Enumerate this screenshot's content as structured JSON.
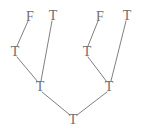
{
  "figure": {
    "kind": "binary-tree-diagram",
    "width": 146,
    "height": 137,
    "background_color": "#ffffff",
    "edge_color": "#808080",
    "label_color": "#6e6e6e",
    "edge_width": 1
  },
  "nodes": [
    {
      "id": "leaf-1",
      "label": "F",
      "x": 30,
      "y": 17,
      "level": 0,
      "role": "leaf"
    },
    {
      "id": "leaf-2",
      "label": "T",
      "x": 53,
      "y": 16,
      "level": 0,
      "role": "leaf"
    },
    {
      "id": "leaf-3",
      "label": "F",
      "x": 100,
      "y": 17,
      "level": 0,
      "role": "leaf"
    },
    {
      "id": "leaf-4",
      "label": "T",
      "x": 127,
      "y": 16,
      "level": 0,
      "role": "leaf"
    },
    {
      "id": "inner-left",
      "label": "T",
      "x": 15,
      "y": 52,
      "level": 1,
      "role": "internal"
    },
    {
      "id": "inner-right",
      "label": "T",
      "x": 87,
      "y": 52,
      "level": 1,
      "role": "internal"
    },
    {
      "id": "mid-left",
      "label": "T",
      "x": 40,
      "y": 87,
      "level": 2,
      "role": "internal"
    },
    {
      "id": "mid-right",
      "label": "T",
      "x": 109,
      "y": 87,
      "level": 2,
      "role": "internal"
    },
    {
      "id": "root",
      "label": "T",
      "x": 73,
      "y": 120,
      "level": 3,
      "role": "root"
    }
  ],
  "edges": [
    {
      "id": "edge-f1-innerleft",
      "from": "leaf-1",
      "to": "inner-left",
      "x1": 28,
      "y1": 21,
      "x2": 17,
      "y2": 46
    },
    {
      "id": "edge-t2-midleft",
      "from": "leaf-2",
      "to": "mid-left",
      "x1": 52,
      "y1": 21,
      "x2": 41,
      "y2": 81
    },
    {
      "id": "edge-innerleft-midleft",
      "from": "inner-left",
      "to": "mid-left",
      "x1": 17,
      "y1": 57,
      "x2": 38,
      "y2": 82
    },
    {
      "id": "edge-f3-innerright",
      "from": "leaf-3",
      "to": "inner-right",
      "x1": 98,
      "y1": 21,
      "x2": 88,
      "y2": 46
    },
    {
      "id": "edge-t4-midright",
      "from": "leaf-4",
      "to": "mid-right",
      "x1": 126,
      "y1": 21,
      "x2": 111,
      "y2": 81
    },
    {
      "id": "edge-innerright-midright",
      "from": "inner-right",
      "to": "mid-right",
      "x1": 88,
      "y1": 57,
      "x2": 107,
      "y2": 82
    },
    {
      "id": "edge-midleft-root",
      "from": "mid-left",
      "to": "root",
      "x1": 42,
      "y1": 92,
      "x2": 70,
      "y2": 115
    },
    {
      "id": "edge-midright-root",
      "from": "mid-right",
      "to": "root",
      "x1": 107,
      "y1": 92,
      "x2": 77,
      "y2": 115
    }
  ]
}
